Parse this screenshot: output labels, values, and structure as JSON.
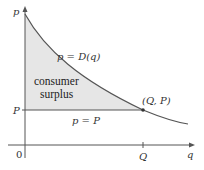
{
  "diagram": {
    "title": "Consumer surplus",
    "axes": {
      "y_label": "p",
      "x_label": "q",
      "origin_label": "0",
      "y_tick_label": "P",
      "x_tick_label": "Q"
    },
    "curve_label": "p = D(q)",
    "price_line_label": "p = P",
    "point_label": "(Q, P)",
    "region_label_line1": "consumer",
    "region_label_line2": "surplus",
    "colors": {
      "axis": "#555555",
      "curve": "#555555",
      "region_fill": "#e6e6e6",
      "text": "#333333"
    }
  }
}
